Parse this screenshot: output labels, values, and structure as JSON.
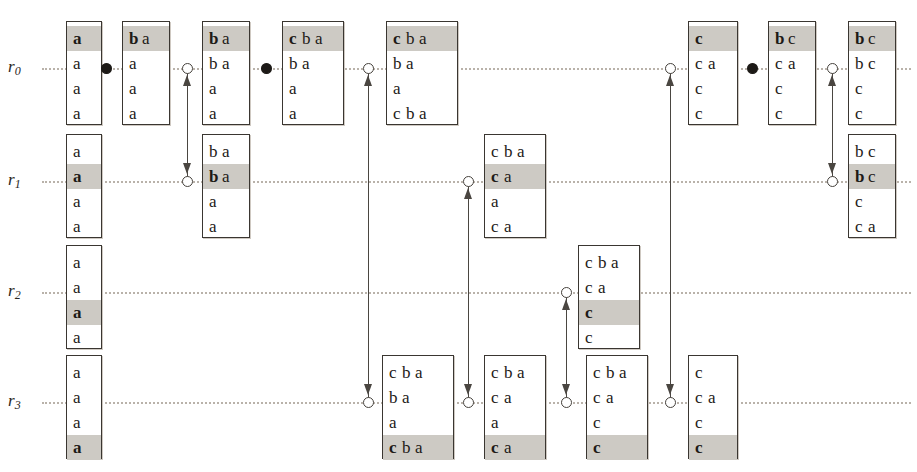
{
  "diagram": {
    "type": "space-time-diagram",
    "width": 917,
    "height": 472,
    "colors": {
      "background": "#ffffff",
      "ink": "#1d1a17",
      "timeline": "#b9b2aa",
      "highlight": "#cdcac4",
      "connector": "#4a4641"
    }
  },
  "rows": [
    {
      "id": "r0",
      "label": "r",
      "sub": "0",
      "y": 68
    },
    {
      "id": "r1",
      "label": "r",
      "sub": "1",
      "y": 181
    },
    {
      "id": "r2",
      "label": "r",
      "sub": "2",
      "y": 292
    },
    {
      "id": "r3",
      "label": "r",
      "sub": "3",
      "y": 402
    }
  ],
  "boxes": [
    {
      "id": "b-r0-0",
      "row": "r0",
      "x": 66,
      "y": 21,
      "w": 36,
      "h": 104,
      "lines": [
        {
          "text": "a",
          "bold": [
            "a"
          ],
          "highlight": true
        },
        {
          "text": "a",
          "bold": [],
          "highlight": false
        },
        {
          "text": "a",
          "bold": [],
          "highlight": false
        },
        {
          "text": "a",
          "bold": [],
          "highlight": false
        }
      ]
    },
    {
      "id": "b-r0-1",
      "row": "r0",
      "x": 122,
      "y": 21,
      "w": 48,
      "h": 104,
      "lines": [
        {
          "text": "b a",
          "bold": [
            "b"
          ],
          "highlight": true
        },
        {
          "text": "a",
          "bold": [],
          "highlight": false
        },
        {
          "text": "a",
          "bold": [],
          "highlight": false
        },
        {
          "text": "a",
          "bold": [],
          "highlight": false
        }
      ]
    },
    {
      "id": "b-r0-2",
      "row": "r0",
      "x": 202,
      "y": 21,
      "w": 48,
      "h": 104,
      "lines": [
        {
          "text": "b a",
          "bold": [
            "b"
          ],
          "highlight": true
        },
        {
          "text": "b a",
          "bold": [],
          "highlight": false
        },
        {
          "text": "a",
          "bold": [],
          "highlight": false
        },
        {
          "text": "a",
          "bold": [],
          "highlight": false
        }
      ]
    },
    {
      "id": "b-r0-3",
      "row": "r0",
      "x": 282,
      "y": 21,
      "w": 62,
      "h": 104,
      "lines": [
        {
          "text": "c b a",
          "bold": [
            "c"
          ],
          "highlight": true
        },
        {
          "text": "b a",
          "bold": [],
          "highlight": false
        },
        {
          "text": "a",
          "bold": [],
          "highlight": false
        },
        {
          "text": "a",
          "bold": [],
          "highlight": false
        }
      ]
    },
    {
      "id": "b-r0-4",
      "row": "r0",
      "x": 386,
      "y": 21,
      "w": 72,
      "h": 104,
      "lines": [
        {
          "text": "c b a",
          "bold": [
            "c"
          ],
          "highlight": true
        },
        {
          "text": "b a",
          "bold": [],
          "highlight": false
        },
        {
          "text": "a",
          "bold": [],
          "highlight": false
        },
        {
          "text": "c b a",
          "bold": [],
          "highlight": false
        }
      ]
    },
    {
      "id": "b-r0-5",
      "row": "r0",
      "x": 688,
      "y": 21,
      "w": 50,
      "h": 104,
      "lines": [
        {
          "text": "c",
          "bold": [
            "c"
          ],
          "highlight": true
        },
        {
          "text": "c a",
          "bold": [],
          "highlight": false
        },
        {
          "text": "c",
          "bold": [],
          "highlight": false
        },
        {
          "text": "c",
          "bold": [],
          "highlight": false
        }
      ]
    },
    {
      "id": "b-r0-6",
      "row": "r0",
      "x": 768,
      "y": 21,
      "w": 48,
      "h": 104,
      "lines": [
        {
          "text": "b c",
          "bold": [
            "b"
          ],
          "highlight": true
        },
        {
          "text": "c a",
          "bold": [],
          "highlight": false
        },
        {
          "text": "c",
          "bold": [],
          "highlight": false
        },
        {
          "text": "c",
          "bold": [],
          "highlight": false
        }
      ]
    },
    {
      "id": "b-r0-7",
      "row": "r0",
      "x": 848,
      "y": 21,
      "w": 48,
      "h": 104,
      "lines": [
        {
          "text": "b c",
          "bold": [
            "b"
          ],
          "highlight": true
        },
        {
          "text": "b c",
          "bold": [],
          "highlight": false
        },
        {
          "text": "c",
          "bold": [],
          "highlight": false
        },
        {
          "text": "c",
          "bold": [],
          "highlight": false
        }
      ]
    },
    {
      "id": "b-r1-0",
      "row": "r1",
      "x": 66,
      "y": 134,
      "w": 36,
      "h": 104,
      "lines": [
        {
          "text": "a",
          "bold": [],
          "highlight": false
        },
        {
          "text": "a",
          "bold": [
            "a"
          ],
          "highlight": true
        },
        {
          "text": "a",
          "bold": [],
          "highlight": false
        },
        {
          "text": "a",
          "bold": [],
          "highlight": false
        }
      ]
    },
    {
      "id": "b-r1-1",
      "row": "r1",
      "x": 202,
      "y": 134,
      "w": 48,
      "h": 104,
      "lines": [
        {
          "text": "b a",
          "bold": [],
          "highlight": false
        },
        {
          "text": "b a",
          "bold": [
            "b"
          ],
          "highlight": true
        },
        {
          "text": "a",
          "bold": [],
          "highlight": false
        },
        {
          "text": "a",
          "bold": [],
          "highlight": false
        }
      ]
    },
    {
      "id": "b-r1-2",
      "row": "r1",
      "x": 484,
      "y": 134,
      "w": 62,
      "h": 104,
      "lines": [
        {
          "text": "c b a",
          "bold": [],
          "highlight": false
        },
        {
          "text": "c a",
          "bold": [
            "c"
          ],
          "highlight": true
        },
        {
          "text": "a",
          "bold": [],
          "highlight": false
        },
        {
          "text": "c a",
          "bold": [],
          "highlight": false
        }
      ]
    },
    {
      "id": "b-r1-3",
      "row": "r1",
      "x": 848,
      "y": 134,
      "w": 48,
      "h": 104,
      "lines": [
        {
          "text": "b c",
          "bold": [],
          "highlight": false
        },
        {
          "text": "b c",
          "bold": [
            "b"
          ],
          "highlight": true
        },
        {
          "text": "c",
          "bold": [],
          "highlight": false
        },
        {
          "text": "c a",
          "bold": [],
          "highlight": false
        }
      ]
    },
    {
      "id": "b-r2-0",
      "row": "r2",
      "x": 66,
      "y": 245,
      "w": 36,
      "h": 104,
      "lines": [
        {
          "text": "a",
          "bold": [],
          "highlight": false
        },
        {
          "text": "a",
          "bold": [],
          "highlight": false
        },
        {
          "text": "a",
          "bold": [
            "a"
          ],
          "highlight": true
        },
        {
          "text": "a",
          "bold": [],
          "highlight": false
        }
      ]
    },
    {
      "id": "b-r2-1",
      "row": "r2",
      "x": 578,
      "y": 245,
      "w": 62,
      "h": 104,
      "lines": [
        {
          "text": "c b a",
          "bold": [],
          "highlight": false
        },
        {
          "text": "c a",
          "bold": [],
          "highlight": false
        },
        {
          "text": "c",
          "bold": [
            "c"
          ],
          "highlight": true
        },
        {
          "text": "c",
          "bold": [],
          "highlight": false
        }
      ]
    },
    {
      "id": "b-r3-0",
      "row": "r3",
      "x": 66,
      "y": 355,
      "w": 36,
      "h": 104,
      "lines": [
        {
          "text": "a",
          "bold": [],
          "highlight": false
        },
        {
          "text": "a",
          "bold": [],
          "highlight": false
        },
        {
          "text": "a",
          "bold": [],
          "highlight": false
        },
        {
          "text": "a",
          "bold": [
            "a"
          ],
          "highlight": true
        }
      ]
    },
    {
      "id": "b-r3-1",
      "row": "r3",
      "x": 382,
      "y": 355,
      "w": 72,
      "h": 104,
      "lines": [
        {
          "text": "c b a",
          "bold": [],
          "highlight": false
        },
        {
          "text": "b a",
          "bold": [],
          "highlight": false
        },
        {
          "text": "a",
          "bold": [],
          "highlight": false
        },
        {
          "text": "c b a",
          "bold": [
            "c"
          ],
          "highlight": true
        }
      ]
    },
    {
      "id": "b-r3-2",
      "row": "r3",
      "x": 484,
      "y": 355,
      "w": 62,
      "h": 104,
      "lines": [
        {
          "text": "c b a",
          "bold": [],
          "highlight": false
        },
        {
          "text": "c a",
          "bold": [],
          "highlight": false
        },
        {
          "text": "a",
          "bold": [],
          "highlight": false
        },
        {
          "text": "c a",
          "bold": [
            "c"
          ],
          "highlight": true
        }
      ]
    },
    {
      "id": "b-r3-3",
      "row": "r3",
      "x": 586,
      "y": 355,
      "w": 62,
      "h": 104,
      "lines": [
        {
          "text": "c b a",
          "bold": [],
          "highlight": false
        },
        {
          "text": "c a",
          "bold": [],
          "highlight": false
        },
        {
          "text": "c",
          "bold": [],
          "highlight": false
        },
        {
          "text": "c",
          "bold": [
            "c"
          ],
          "highlight": true
        }
      ]
    },
    {
      "id": "b-r3-4",
      "row": "r3",
      "x": 688,
      "y": 355,
      "w": 50,
      "h": 104,
      "lines": [
        {
          "text": "c",
          "bold": [],
          "highlight": false
        },
        {
          "text": "c a",
          "bold": [],
          "highlight": false
        },
        {
          "text": "c",
          "bold": [],
          "highlight": false
        },
        {
          "text": "c",
          "bold": [
            "c"
          ],
          "highlight": true
        }
      ]
    }
  ],
  "events": [
    {
      "id": "e-r0-op1",
      "kind": "solid",
      "row": "r0",
      "x": 106,
      "y": 68
    },
    {
      "id": "e-r0-rcv1",
      "kind": "open",
      "row": "r0",
      "x": 187,
      "y": 68
    },
    {
      "id": "e-r0-op2",
      "kind": "solid",
      "row": "r0",
      "x": 266,
      "y": 68
    },
    {
      "id": "e-r0-rcv2",
      "kind": "open",
      "row": "r0",
      "x": 368,
      "y": 68
    },
    {
      "id": "e-r0-rcv3",
      "kind": "open",
      "row": "r0",
      "x": 670,
      "y": 68
    },
    {
      "id": "e-r0-op3",
      "kind": "solid",
      "row": "r0",
      "x": 752,
      "y": 68
    },
    {
      "id": "e-r0-rcv4",
      "kind": "open",
      "row": "r0",
      "x": 832,
      "y": 68
    },
    {
      "id": "e-r1-rcv1",
      "kind": "open",
      "row": "r1",
      "x": 187,
      "y": 181
    },
    {
      "id": "e-r1-rcv2",
      "kind": "open",
      "row": "r1",
      "x": 468,
      "y": 181
    },
    {
      "id": "e-r1-rcv3",
      "kind": "open",
      "row": "r1",
      "x": 832,
      "y": 181
    },
    {
      "id": "e-r2-rcv1",
      "kind": "open",
      "row": "r2",
      "x": 566,
      "y": 292
    },
    {
      "id": "e-r3-rcv1",
      "kind": "open",
      "row": "r3",
      "x": 368,
      "y": 402
    },
    {
      "id": "e-r3-rcv2",
      "kind": "open",
      "row": "r3",
      "x": 468,
      "y": 402
    },
    {
      "id": "e-r3-rcv3",
      "kind": "open",
      "row": "r3",
      "x": 566,
      "y": 402
    },
    {
      "id": "e-r3-rcv4",
      "kind": "open",
      "row": "r3",
      "x": 670,
      "y": 402
    }
  ],
  "connectors": [
    {
      "id": "c-0",
      "x": 187,
      "y1": 68,
      "y2": 181,
      "arrow_up": true,
      "arrow_down": true
    },
    {
      "id": "c-1",
      "x": 368,
      "y1": 68,
      "y2": 402,
      "arrow_up": true,
      "arrow_down": true
    },
    {
      "id": "c-2",
      "x": 468,
      "y1": 181,
      "y2": 402,
      "arrow_up": true,
      "arrow_down": true
    },
    {
      "id": "c-3",
      "x": 566,
      "y1": 292,
      "y2": 402,
      "arrow_up": true,
      "arrow_down": true
    },
    {
      "id": "c-4",
      "x": 670,
      "y1": 68,
      "y2": 402,
      "arrow_up": true,
      "arrow_down": true
    },
    {
      "id": "c-5",
      "x": 832,
      "y1": 68,
      "y2": 181,
      "arrow_up": true,
      "arrow_down": true
    }
  ]
}
